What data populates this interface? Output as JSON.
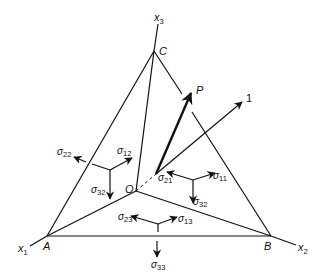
{
  "figure": {
    "points": {
      "A": "A",
      "B": "B",
      "C": "C",
      "O": "O",
      "P": "P",
      "one": "1"
    },
    "axes": {
      "x1": {
        "base": "x",
        "sub": "1"
      },
      "x2": {
        "base": "x",
        "sub": "2"
      },
      "x3": {
        "base": "x",
        "sub": "3"
      }
    },
    "stresses": {
      "s22": {
        "base": "σ",
        "sub": "22"
      },
      "s12": {
        "base": "σ",
        "sub": "12"
      },
      "s32_left": {
        "base": "σ",
        "sub": "32"
      },
      "s21": {
        "base": "σ",
        "sub": "21"
      },
      "s11": {
        "base": "σ",
        "sub": "11"
      },
      "s32_right": {
        "base": "σ",
        "sub": "32"
      },
      "s23": {
        "base": "σ",
        "sub": "23"
      },
      "s13": {
        "base": "σ",
        "sub": "13"
      },
      "s33": {
        "base": "σ",
        "sub": "33"
      }
    },
    "colors": {
      "ink": "#111111",
      "background": "#ffffff"
    }
  }
}
